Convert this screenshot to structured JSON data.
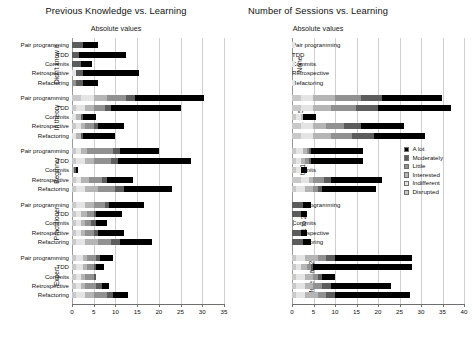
{
  "legend": {
    "position": "right",
    "entries": [
      {
        "label": "A lot",
        "key": "alot",
        "color": "#000000"
      },
      {
        "label": "Moderately",
        "key": "mod",
        "color": "#5c5c5c"
      },
      {
        "label": "Little",
        "key": "lit",
        "color": "#919191"
      },
      {
        "label": "Interested",
        "key": "int",
        "color": "#b5b5b5"
      },
      {
        "label": "Indifferent",
        "key": "ind",
        "color": "#e4e4e4"
      },
      {
        "label": "Disrupted",
        "key": "dis",
        "color": "#c9c9c9"
      }
    ]
  },
  "chart_data": [
    {
      "type": "bar",
      "orientation": "horizontal",
      "stacked": true,
      "title": "Previous Knowledge vs. Learning",
      "subtitle": "Absolute values",
      "xlabel": "",
      "ylabel": "",
      "xlim": [
        0,
        35
      ],
      "xticks": [
        0,
        5,
        10,
        15,
        20,
        25,
        30,
        35
      ],
      "grid": true,
      "series": [
        "Disrupted",
        "Indifferent",
        "Interested",
        "Little",
        "Moderately",
        "A lot"
      ],
      "bar_categories": [
        "Pair programming",
        "TDD",
        "Commits",
        "Retrospective",
        "Refactoring"
      ],
      "groups": [
        {
          "label": "Didn't know it",
          "bars": [
            {
              "category": "Pair programming",
              "values": {
                "dis": 0,
                "ind": 0,
                "int": 0,
                "lit": 0,
                "mod": 2.5,
                "alot": 3.5
              },
              "total": 6
            },
            {
              "category": "TDD",
              "values": {
                "dis": 0,
                "ind": 0,
                "int": 0,
                "lit": 0,
                "mod": 1.5,
                "alot": 11
              },
              "total": 12.5
            },
            {
              "category": "Commits",
              "values": {
                "dis": 0,
                "ind": 0,
                "int": 0,
                "lit": 0,
                "mod": 2,
                "alot": 2.5
              },
              "total": 4.5
            },
            {
              "category": "Retrospective",
              "values": {
                "dis": 0,
                "ind": 1,
                "int": 0,
                "lit": 0,
                "mod": 1.5,
                "alot": 13
              },
              "total": 15.5
            },
            {
              "category": "Refactoring",
              "values": {
                "dis": 0,
                "ind": 0,
                "int": 0,
                "lit": 1,
                "mod": 1.5,
                "alot": 3.5
              },
              "total": 6
            }
          ]
        },
        {
          "label": "In theory",
          "bars": [
            {
              "category": "Pair programming",
              "values": {
                "dis": 2,
                "ind": 3,
                "int": 3,
                "lit": 4.5,
                "mod": 2,
                "alot": 16
              },
              "total": 30.5
            },
            {
              "category": "TDD",
              "values": {
                "dis": 1,
                "ind": 2,
                "int": 2,
                "lit": 2.5,
                "mod": 1.5,
                "alot": 16
              },
              "total": 25
            },
            {
              "category": "Commits",
              "values": {
                "dis": 0,
                "ind": 1,
                "int": 1,
                "lit": 0,
                "mod": 0.5,
                "alot": 3
              },
              "total": 5.5
            },
            {
              "category": "Retrospective",
              "values": {
                "dis": 1,
                "ind": 1,
                "int": 1,
                "lit": 2,
                "mod": 1,
                "alot": 6
              },
              "total": 12
            },
            {
              "category": "Refactoring",
              "values": {
                "dis": 0,
                "ind": 1,
                "int": 1,
                "lit": 0,
                "mod": 0.5,
                "alot": 7.5
              },
              "total": 10
            }
          ]
        },
        {
          "label": "Beginner",
          "bars": [
            {
              "category": "Pair programming",
              "values": {
                "dis": 1,
                "ind": 1,
                "int": 1.5,
                "lit": 6,
                "mod": 1.5,
                "alot": 9
              },
              "total": 20
            },
            {
              "category": "TDD",
              "values": {
                "dis": 1,
                "ind": 2,
                "int": 2,
                "lit": 4,
                "mod": 1.5,
                "alot": 17
              },
              "total": 27.5
            },
            {
              "category": "Commits",
              "values": {
                "dis": 0,
                "ind": 0,
                "int": 0.5,
                "lit": 0,
                "mod": 0.5,
                "alot": 0.5
              },
              "total": 1.5
            },
            {
              "category": "Retrospective",
              "values": {
                "dis": 1,
                "ind": 1,
                "int": 2,
                "lit": 3,
                "mod": 1,
                "alot": 6
              },
              "total": 14
            },
            {
              "category": "Refactoring",
              "values": {
                "dis": 1,
                "ind": 2,
                "int": 3,
                "lit": 4,
                "mod": 2,
                "alot": 11
              },
              "total": 23
            }
          ]
        },
        {
          "label": "Practitioner",
          "bars": [
            {
              "category": "Pair programming",
              "values": {
                "dis": 1,
                "ind": 2,
                "int": 2,
                "lit": 2.5,
                "mod": 1,
                "alot": 8
              },
              "total": 16.5
            },
            {
              "category": "TDD",
              "values": {
                "dis": 1,
                "ind": 1,
                "int": 1.5,
                "lit": 1.5,
                "mod": 0.5,
                "alot": 6
              },
              "total": 11.5
            },
            {
              "category": "Commits",
              "values": {
                "dis": 1,
                "ind": 1,
                "int": 1,
                "lit": 1.5,
                "mod": 1,
                "alot": 2.5
              },
              "total": 8
            },
            {
              "category": "Retrospective",
              "values": {
                "dis": 1,
                "ind": 1,
                "int": 1,
                "lit": 2,
                "mod": 1,
                "alot": 6
              },
              "total": 12
            },
            {
              "category": "Refactoring",
              "values": {
                "dis": 1,
                "ind": 2,
                "int": 3,
                "lit": 3,
                "mod": 2,
                "alot": 7.5
              },
              "total": 18.5
            }
          ]
        },
        {
          "label": "Expert",
          "bars": [
            {
              "category": "Pair programming",
              "values": {
                "dis": 1,
                "ind": 1.5,
                "int": 1,
                "lit": 2,
                "mod": 1,
                "alot": 3
              },
              "total": 9.5
            },
            {
              "category": "TDD",
              "values": {
                "dis": 1,
                "ind": 1.5,
                "int": 1,
                "lit": 1.5,
                "mod": 0.5,
                "alot": 2
              },
              "total": 7.5
            },
            {
              "category": "Commits",
              "values": {
                "dis": 1,
                "ind": 1,
                "int": 1,
                "lit": 2,
                "mod": 0.5,
                "alot": 0
              },
              "total": 5.5
            },
            {
              "category": "Retrospective",
              "values": {
                "dis": 1,
                "ind": 1,
                "int": 1,
                "lit": 2.5,
                "mod": 1.5,
                "alot": 1.5
              },
              "total": 8.5
            },
            {
              "category": "Refactoring",
              "values": {
                "dis": 1,
                "ind": 2,
                "int": 2,
                "lit": 3,
                "mod": 1.5,
                "alot": 3.5
              },
              "total": 13
            }
          ]
        }
      ]
    },
    {
      "type": "bar",
      "orientation": "horizontal",
      "stacked": true,
      "title": "Number of Sessions vs. Learning",
      "subtitle": "Absolute values",
      "xlabel": "",
      "ylabel": "",
      "xlim": [
        0,
        40
      ],
      "xticks": [
        0,
        5,
        10,
        15,
        20,
        25,
        30,
        35,
        40
      ],
      "grid": true,
      "series": [
        "Disrupted",
        "Indifferent",
        "Interested",
        "Little",
        "Moderately",
        "A lot"
      ],
      "bar_categories": [
        "Pair programming",
        "TDD",
        "Commits",
        "Retrospective",
        "Refactoring"
      ],
      "groups": [
        {
          "label": "None",
          "bars": [
            {
              "category": "Pair programming",
              "values": {
                "dis": 0,
                "ind": 0.6,
                "int": 0,
                "lit": 0,
                "mod": 0,
                "alot": 0
              },
              "total": 0.6
            },
            {
              "category": "TDD",
              "values": {
                "dis": 0,
                "ind": 0,
                "int": 0,
                "lit": 0,
                "mod": 0,
                "alot": 0
              },
              "total": 0
            },
            {
              "category": "Commits",
              "values": {
                "dis": 0,
                "ind": 0.6,
                "int": 0,
                "lit": 0,
                "mod": 0,
                "alot": 0
              },
              "total": 0.6
            },
            {
              "category": "Retrospective",
              "values": {
                "dis": 0,
                "ind": 0,
                "int": 0,
                "lit": 0,
                "mod": 0,
                "alot": 0
              },
              "total": 0
            },
            {
              "category": "Refactoring",
              "values": {
                "dis": 0,
                "ind": 0.6,
                "int": 0,
                "lit": 0,
                "mod": 0,
                "alot": 0
              },
              "total": 0.6
            }
          ]
        },
        {
          "label": "1 to 5",
          "bars": [
            {
              "category": "Pair programming",
              "values": {
                "dis": 2,
                "ind": 3,
                "int": 5,
                "lit": 6,
                "mod": 5,
                "alot": 14
              },
              "total": 35
            },
            {
              "category": "TDD",
              "values": {
                "dis": 2,
                "ind": 3,
                "int": 4,
                "lit": 6,
                "mod": 5,
                "alot": 17
              },
              "total": 37
            },
            {
              "category": "Commits",
              "values": {
                "dis": 1,
                "ind": 1,
                "int": 0.5,
                "lit": 0,
                "mod": 0,
                "alot": 3
              },
              "total": 5.5
            },
            {
              "category": "Retrospective",
              "values": {
                "dis": 2,
                "ind": 3,
                "int": 3,
                "lit": 4,
                "mod": 4,
                "alot": 10
              },
              "total": 26
            },
            {
              "category": "Refactoring",
              "values": {
                "dis": 2,
                "ind": 3,
                "int": 4,
                "lit": 5,
                "mod": 5,
                "alot": 12
              },
              "total": 31
            }
          ]
        },
        {
          "label": "6 to 10",
          "bars": [
            {
              "category": "Pair programming",
              "values": {
                "dis": 1,
                "ind": 1.5,
                "int": 1,
                "lit": 0.5,
                "mod": 0.5,
                "alot": 12
              },
              "total": 16.5
            },
            {
              "category": "TDD",
              "values": {
                "dis": 1,
                "ind": 1,
                "int": 1,
                "lit": 1,
                "mod": 0.5,
                "alot": 12
              },
              "total": 16.5
            },
            {
              "category": "Commits",
              "values": {
                "dis": 1,
                "ind": 1,
                "int": 0,
                "lit": 0,
                "mod": 0,
                "alot": 1.5
              },
              "total": 3.5
            },
            {
              "category": "Retrospective",
              "values": {
                "dis": 2,
                "ind": 2,
                "int": 1,
                "lit": 2.5,
                "mod": 1.5,
                "alot": 12
              },
              "total": 21
            },
            {
              "category": "Refactoring",
              "values": {
                "dis": 1,
                "ind": 2,
                "int": 2,
                "lit": 1,
                "mod": 1,
                "alot": 12.5
              },
              "total": 19.5
            }
          ]
        },
        {
          "label": "11 to 20",
          "bars": [
            {
              "category": "Pair programming",
              "values": {
                "dis": 0,
                "ind": 0,
                "int": 0,
                "lit": 0,
                "mod": 2.5,
                "alot": 2
              },
              "total": 4.5
            },
            {
              "category": "TDD",
              "values": {
                "dis": 0,
                "ind": 0,
                "int": 0,
                "lit": 0,
                "mod": 2,
                "alot": 1.5
              },
              "total": 3.5
            },
            {
              "category": "Commits",
              "values": {
                "dis": 0,
                "ind": 0,
                "int": 0,
                "lit": 0.5,
                "mod": 0,
                "alot": 0
              },
              "total": 0.5
            },
            {
              "category": "Retrospective",
              "values": {
                "dis": 0,
                "ind": 0,
                "int": 0,
                "lit": 0,
                "mod": 2,
                "alot": 1.5
              },
              "total": 3.5
            },
            {
              "category": "Refactoring",
              "values": {
                "dis": 0,
                "ind": 0,
                "int": 0,
                "lit": 0,
                "mod": 2.5,
                "alot": 2
              },
              "total": 4.5
            }
          ]
        },
        {
          "label": "More than 20",
          "bars": [
            {
              "category": "Pair programming",
              "values": {
                "dis": 1,
                "ind": 2,
                "int": 3,
                "lit": 2,
                "mod": 2,
                "alot": 18
              },
              "total": 28
            },
            {
              "category": "TDD",
              "values": {
                "dis": 1,
                "ind": 1,
                "int": 1.5,
                "lit": 1,
                "mod": 0.5,
                "alot": 23
              },
              "total": 28
            },
            {
              "category": "Commits",
              "values": {
                "dis": 1,
                "ind": 2,
                "int": 2,
                "lit": 1,
                "mod": 1,
                "alot": 3
              },
              "total": 10
            },
            {
              "category": "Retrospective",
              "values": {
                "dis": 1,
                "ind": 2,
                "int": 2,
                "lit": 2,
                "mod": 2,
                "alot": 14
              },
              "total": 23
            },
            {
              "category": "Refactoring",
              "values": {
                "dis": 1,
                "ind": 2,
                "int": 3,
                "lit": 2,
                "mod": 2,
                "alot": 17.5
              },
              "total": 27.5
            }
          ]
        }
      ]
    }
  ]
}
